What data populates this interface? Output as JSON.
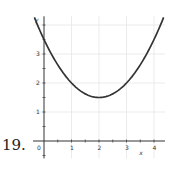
{
  "problem_number": "19.",
  "chart_data": {
    "type": "line",
    "title": "",
    "xlabel": "x",
    "ylabel": "y",
    "x_ticks": [
      "0",
      "1",
      "2",
      "3",
      "4"
    ],
    "y_ticks": [
      "1",
      "2",
      "3"
    ],
    "xlim": [
      -0.4,
      4.4
    ],
    "ylim": [
      -0.6,
      4.3
    ],
    "grid": true,
    "series": [
      {
        "name": "f(x)",
        "function": "0.5*(x-2)^2 + 1.5",
        "x": [
          -0.35,
          0,
          0.5,
          1,
          1.5,
          2,
          2.5,
          3,
          3.5,
          4,
          4.35
        ],
        "y": [
          4.26,
          3.5,
          2.625,
          2.0,
          1.625,
          1.5,
          1.625,
          2.0,
          2.625,
          3.5,
          4.26
        ],
        "color": "#333333"
      }
    ],
    "annotations": [
      "vertex at (2, 1.5)",
      "y-intercept 3.5"
    ]
  }
}
